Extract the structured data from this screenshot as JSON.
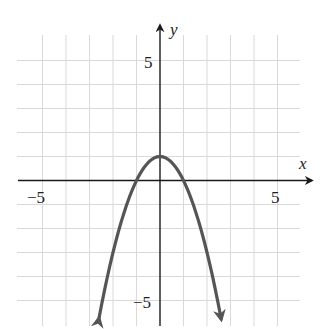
{
  "chart_data": {
    "type": "line",
    "title": "",
    "xlabel": "x",
    "ylabel": "y",
    "xlim": [
      -6,
      6
    ],
    "ylim": [
      -6,
      6
    ],
    "grid": true,
    "grid_step": 1,
    "x_tick_labels": [
      {
        "value": -5,
        "label": "−5"
      },
      {
        "value": 5,
        "label": "5"
      }
    ],
    "y_tick_labels": [
      {
        "value": 5,
        "label": "5"
      },
      {
        "value": -5,
        "label": "−5"
      }
    ],
    "series": [
      {
        "name": "y = 1 − x²",
        "equation": "y = -x^2 + 1",
        "vertex": [
          0,
          1
        ],
        "x_intercepts": [
          -1,
          1
        ],
        "y_intercept": 1,
        "x": [
          -2.6,
          -2,
          -1.5,
          -1,
          -0.5,
          0,
          0.5,
          1,
          1.5,
          2,
          2.6
        ],
        "values": [
          -5.76,
          -3,
          -1.25,
          0,
          0.75,
          1,
          0.75,
          0,
          -1.25,
          -3,
          -5.76
        ],
        "end_arrows": true,
        "color": "#555555"
      }
    ]
  },
  "labels": {
    "x_axis": "x",
    "y_axis": "y",
    "x_neg5": "−5",
    "x_pos5": "5",
    "y_pos5": "5",
    "y_neg5": "−5"
  }
}
